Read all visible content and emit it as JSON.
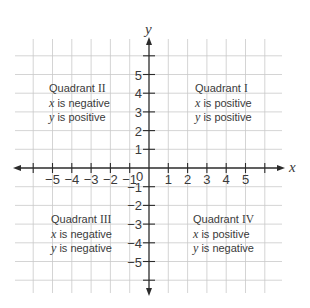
{
  "diagram": {
    "colors": {
      "grid": "#c9c9c9",
      "axis": "#2b2b2b",
      "text": "#3a3a3a",
      "background": "#ffffff"
    },
    "axes": {
      "x_label": "x",
      "y_label": "y",
      "origin_label": "0",
      "x_ticks": [
        "−5",
        "−4",
        "−3",
        "−2",
        "−1",
        "1",
        "2",
        "3",
        "4",
        "5"
      ],
      "x_tick_values": [
        -5,
        -4,
        -3,
        -2,
        -1,
        1,
        2,
        3,
        4,
        5
      ],
      "y_ticks": [
        "5",
        "4",
        "3",
        "2",
        "1",
        "−1",
        "−2",
        "−3",
        "−4",
        "−5"
      ],
      "y_tick_values": [
        5,
        4,
        3,
        2,
        1,
        -1,
        -2,
        -3,
        -4,
        -5
      ],
      "range": [
        -6,
        6
      ]
    },
    "quadrants": [
      {
        "id": "II",
        "title_prefix": "Quadrant",
        "numeral": "II",
        "x_var": "x",
        "x_text": " is negative",
        "y_var": "y",
        "y_text": " is positive"
      },
      {
        "id": "I",
        "title_prefix": "Quadrant",
        "numeral": "I",
        "x_var": "x",
        "x_text": " is positive",
        "y_var": "y",
        "y_text": " is positive"
      },
      {
        "id": "III",
        "title_prefix": "Quadrant",
        "numeral": "III",
        "x_var": "x",
        "x_text": " is negative",
        "y_var": "y",
        "y_text": " is negative"
      },
      {
        "id": "IV",
        "title_prefix": "Quadrant",
        "numeral": "IV",
        "x_var": "x",
        "x_text": " is positive",
        "y_var": "y",
        "y_text": " is negative"
      }
    ]
  }
}
